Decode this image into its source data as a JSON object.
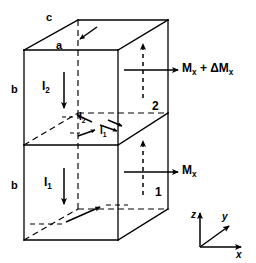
{
  "figure": {
    "stroke_color": "#000000",
    "background_color": "#ffffff",
    "dimensions": {
      "top_edge_label": "c",
      "front_top_edge_label": "a",
      "upper_height_label": "b",
      "lower_height_label": "b"
    },
    "currents": {
      "upper_label_main": "I",
      "upper_label_sub": "2",
      "lower_label_main": "I",
      "lower_label_sub": "1",
      "mid_upper_main": "I",
      "mid_upper_sub": "2",
      "mid_lower_main": "I",
      "mid_lower_sub": "1"
    },
    "moments": {
      "upper_main": "M",
      "upper_sub": "x",
      "upper_extra": " + ΔM",
      "upper_extra_sub": "x",
      "lower_main": "M",
      "lower_sub": "x"
    },
    "corner_labels": {
      "interface": "2",
      "bottom": "1"
    },
    "axes": {
      "z": "z",
      "y": "y",
      "x": "x"
    }
  }
}
